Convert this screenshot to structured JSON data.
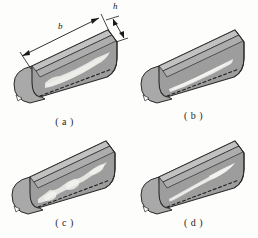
{
  "figure": {
    "background_color": "#fdfdfc",
    "ink_color": "#1a1a1a",
    "body_fill_color": "#9c9c9c",
    "body_shade_color": "#8a8a8a",
    "end_cap_color": "#a8a8a8",
    "top_face_color": "#b4b4b4",
    "defect_color": "#e8e8e4"
  },
  "dimensions": {
    "length_label": "b",
    "height_label": "h"
  },
  "panels": [
    {
      "id": "a",
      "caption": "( a )",
      "defect_name": "long-irregular-band-defect",
      "description": "Large elongated light inclusion spanning nearly the full length of the inclined face"
    },
    {
      "id": "b",
      "caption": "( b )",
      "defect_name": "narrow-streak-defect",
      "description": "Thin narrow light streak along the lower part of the inclined face"
    },
    {
      "id": "c",
      "caption": "( c )",
      "defect_name": "wavy-chain-defect",
      "description": "Wavy chain-like light inclusion running diagonally across the face"
    },
    {
      "id": "d",
      "caption": "( d )",
      "defect_name": "tapered-wedge-defect",
      "description": "Tapered wedge inclusion, wide at the upper right narrowing to the lower left"
    }
  ]
}
